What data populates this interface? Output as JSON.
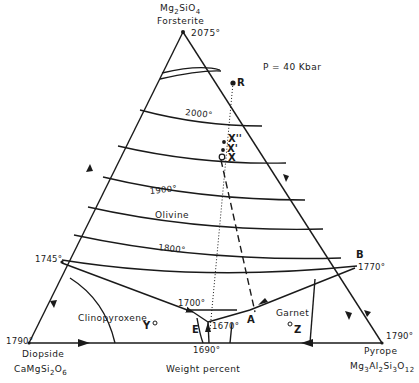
{
  "diagram": {
    "title_apex": {
      "formula": "Mg2SiO4",
      "formula_main": "Mg",
      "formula_parts": [
        "Mg",
        "2",
        "SiO",
        "4"
      ],
      "name": "Forsterite",
      "temp": "2075°"
    },
    "pressure": "P = 40 Kbar",
    "left_corner": {
      "name": "Diopside",
      "formula_parts": [
        "CaMgSi",
        "2",
        "O",
        "6"
      ],
      "temp": "1790°"
    },
    "right_corner": {
      "name": "Pyrope",
      "formula_parts": [
        "Mg",
        "3",
        "Al",
        "2",
        "Si",
        "3",
        "O",
        "12"
      ],
      "temp": "1790°"
    },
    "axis_label": "Weight percent",
    "isotherms": [
      {
        "label": "2000°"
      },
      {
        "label": "1900°"
      },
      {
        "label": "1800°"
      },
      {
        "label": "1700°"
      }
    ],
    "fields": [
      {
        "name": "Olivine"
      },
      {
        "name": "Clinopyroxene"
      },
      {
        "name": "Garnet"
      }
    ],
    "points": {
      "R": "R",
      "X2": "X''",
      "X1": "X'",
      "X": "X",
      "B": "B",
      "B_temp": "1770°",
      "A": "A",
      "E": "E",
      "E_temp": "1670°",
      "left_edge_temp": "1745°",
      "base_temp": "1690°",
      "Y": "Y",
      "Z": "Z"
    }
  }
}
